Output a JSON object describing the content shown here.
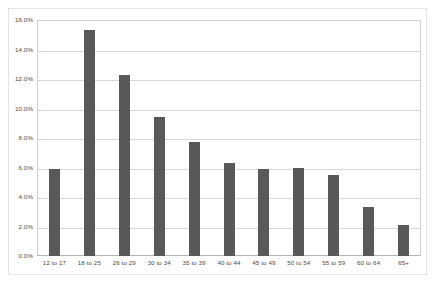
{
  "chart_data": {
    "type": "bar",
    "title": "",
    "xlabel": "",
    "ylabel": "",
    "ylim": [
      0,
      16
    ],
    "ytick_labels": [
      "16.0%",
      "14.0%",
      "12.0%",
      "10.0%",
      "8.0%",
      "6.0%",
      "4.0%",
      "2.0%",
      "0.0%"
    ],
    "ytick_values": [
      16,
      14,
      12,
      10,
      8,
      6,
      4,
      2,
      0
    ],
    "grid": true,
    "legend": "none",
    "categories": [
      "12 to 17",
      "18 to 25",
      "26 to 29",
      "30 to 34",
      "35 to 39",
      "40 to 44",
      "45 to 49",
      "50 to 54",
      "55 to 59",
      "60 to 64",
      "65+"
    ],
    "values": [
      5.9,
      15.3,
      12.3,
      9.4,
      7.7,
      6.3,
      5.9,
      6.0,
      5.5,
      3.3,
      2.1
    ],
    "bar_color": "#595959",
    "grid_color": "#d9d9d9",
    "axis_color": "#b5b5b5",
    "background_color": "#ffffff"
  }
}
